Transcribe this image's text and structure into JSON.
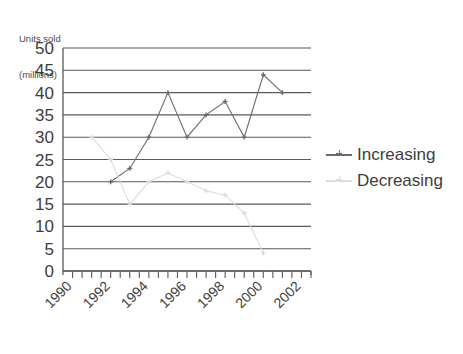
{
  "yaxis_title": {
    "line1": "Units sold",
    "line2": "(millions)"
  },
  "legend": {
    "items": [
      {
        "label": "Increasing",
        "color": "#6b6b6b",
        "marker": "plus-marker"
      },
      {
        "label": "Decreasing",
        "color": "#dcdcdc",
        "marker": "plus-marker"
      }
    ]
  },
  "chart_data": {
    "type": "line",
    "title": "",
    "xlabel": "",
    "ylabel": "Units sold (millions)",
    "xlim": [
      1989.5,
      2002.5
    ],
    "ylim": [
      0,
      50
    ],
    "ytick_labels": [
      "0",
      "5",
      "10",
      "15",
      "20",
      "25",
      "30",
      "35",
      "40",
      "45",
      "50"
    ],
    "ytick_values": [
      0,
      5,
      10,
      15,
      20,
      25,
      30,
      35,
      40,
      45,
      50
    ],
    "xtick_labels": [
      "1990",
      "1992",
      "1994",
      "1996",
      "1998",
      "2000",
      "2002"
    ],
    "xtick_values": [
      1990,
      1992,
      1994,
      1996,
      1998,
      2000,
      2002
    ],
    "xtick_minor_values": [
      1990,
      1991,
      1992,
      1993,
      1994,
      1995,
      1996,
      1997,
      1998,
      1999,
      2000,
      2001,
      2002
    ],
    "xtick_label_rotation": -45,
    "grid": "horizontal",
    "legend_position": "right",
    "series": [
      {
        "name": "Increasing",
        "color": "#6b6b6b",
        "marker": "plus-marker",
        "x": [
          1992,
          1993,
          1994,
          1995,
          1996,
          1997,
          1998,
          1999,
          2000,
          2001
        ],
        "values": [
          20,
          23,
          30,
          40,
          30,
          35,
          38,
          30,
          44,
          40
        ]
      },
      {
        "name": "Decreasing",
        "color": "#dcdcdc",
        "marker": "plus-marker",
        "x": [
          1991,
          1992,
          1993,
          1994,
          1995,
          1996,
          1997,
          1998,
          1999,
          2000
        ],
        "values": [
          30,
          25,
          15,
          20,
          22,
          20,
          18,
          17,
          13,
          4
        ]
      }
    ]
  }
}
